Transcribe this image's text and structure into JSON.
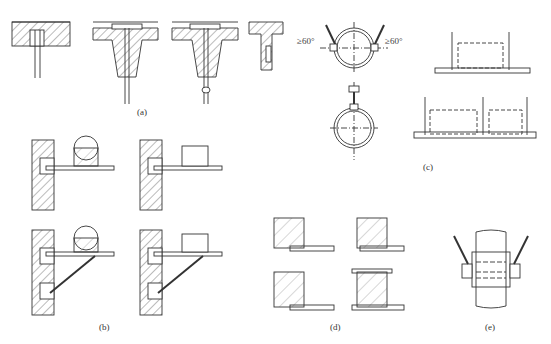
{
  "panels": {
    "a": {
      "label": "(a)"
    },
    "b": {
      "label": "(b)"
    },
    "c": {
      "label": "(c)"
    },
    "d": {
      "label": "(d)"
    },
    "e": {
      "label": "(e)"
    }
  },
  "annotations": {
    "angle_left": "≥60°",
    "angle_right": "≥60°"
  },
  "colors": {
    "line": "#333333",
    "hatch": "#555555",
    "background": "#ffffff"
  }
}
